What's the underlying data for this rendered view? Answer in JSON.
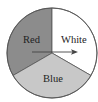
{
  "diagram": {
    "type": "spinner",
    "sectors": [
      {
        "label": "Red",
        "color": "#8c8c8c",
        "start_deg": 240,
        "end_deg": 360
      },
      {
        "label": "White",
        "color": "#ffffff",
        "start_deg": 0,
        "end_deg": 120
      },
      {
        "label": "Blue",
        "color": "#c8c8c8",
        "start_deg": 120,
        "end_deg": 240
      }
    ],
    "arrow": {
      "direction": "right"
    }
  }
}
